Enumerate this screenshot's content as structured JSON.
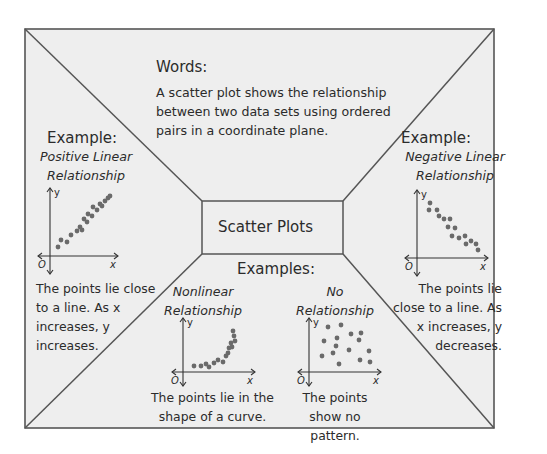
{
  "colors": {
    "background": "#ffffff",
    "frame_fill": "#eeeeee",
    "frame_stroke": "#555555",
    "text": "#2b2b2b",
    "dot": "#6a6a6a"
  },
  "frame": {
    "x1": 25,
    "y1": 29,
    "x2": 494,
    "y2": 428
  },
  "center_box": {
    "x1": 202,
    "y1": 201,
    "x2": 343,
    "y2": 254,
    "label": "Scatter Plots"
  },
  "words": {
    "title": "Words:",
    "body": "A scatter plot shows the relationship between two data sets using ordered pairs in a coordinate plane."
  },
  "examples_heading": "Examples:",
  "panels": [
    {
      "id": "positive",
      "title": "Example:",
      "subtitle_lines": [
        "Positive Linear",
        "Relationship"
      ],
      "description": "The points lie close to a line. As x increases, y increases.",
      "axis_labels": {
        "y": "y",
        "x": "x",
        "origin": "O"
      }
    },
    {
      "id": "negative",
      "title": "Example:",
      "subtitle_lines": [
        "Negative Linear",
        "Relationship"
      ],
      "description": "The points lie close to a line. As x increases, y decreases.",
      "axis_labels": {
        "y": "y",
        "x": "x",
        "origin": "O"
      }
    },
    {
      "id": "nonlinear",
      "subtitle_lines": [
        "Nonlinear",
        "Relationship"
      ],
      "description": "The points lie in the shape of a curve.",
      "axis_labels": {
        "y": "y",
        "x": "x",
        "origin": "O"
      }
    },
    {
      "id": "none",
      "subtitle_lines": [
        "No",
        "Relationship"
      ],
      "description": "The points show no pattern.",
      "axis_labels": {
        "y": "y",
        "x": "x",
        "origin": "O"
      }
    }
  ],
  "plots": {
    "positive": {
      "origin": [
        50,
        256
      ],
      "x_end": 118,
      "y_top": 188,
      "x_start": 38,
      "y_bottom": 274,
      "points": [
        [
          58,
          247
        ],
        [
          61,
          240
        ],
        [
          67,
          242
        ],
        [
          71,
          235
        ],
        [
          77,
          231
        ],
        [
          80,
          227
        ],
        [
          82,
          230
        ],
        [
          84,
          219
        ],
        [
          87,
          222
        ],
        [
          88,
          214
        ],
        [
          92,
          216
        ],
        [
          93,
          207
        ],
        [
          97,
          210
        ],
        [
          100,
          204
        ],
        [
          102,
          206
        ],
        [
          105,
          201
        ],
        [
          108,
          198
        ],
        [
          110,
          196
        ]
      ]
    },
    "negative": {
      "origin": [
        417,
        258
      ],
      "x_end": 488,
      "y_top": 190,
      "x_start": 405,
      "y_bottom": 276,
      "points": [
        [
          430,
          203
        ],
        [
          429,
          210
        ],
        [
          437,
          210
        ],
        [
          439,
          216
        ],
        [
          444,
          219
        ],
        [
          450,
          219
        ],
        [
          448,
          227
        ],
        [
          455,
          228
        ],
        [
          452,
          236
        ],
        [
          459,
          238
        ],
        [
          465,
          236
        ],
        [
          466,
          244
        ],
        [
          471,
          241
        ],
        [
          476,
          244
        ],
        [
          478,
          250
        ]
      ]
    },
    "nonlinear": {
      "origin": [
        183,
        372
      ],
      "x_end": 255,
      "y_top": 318,
      "x_start": 172,
      "y_bottom": 386,
      "points": [
        [
          194,
          366
        ],
        [
          201,
          366
        ],
        [
          206,
          364
        ],
        [
          209,
          367
        ],
        [
          214,
          363
        ],
        [
          218,
          360
        ],
        [
          223,
          362
        ],
        [
          226,
          356
        ],
        [
          228,
          353
        ],
        [
          229,
          348
        ],
        [
          232,
          347
        ],
        [
          231,
          343
        ],
        [
          235,
          341
        ],
        [
          234,
          336
        ],
        [
          233,
          331
        ]
      ]
    },
    "none": {
      "origin": [
        309,
        372
      ],
      "x_end": 381,
      "y_top": 318,
      "x_start": 298,
      "y_bottom": 386,
      "points": [
        [
          328,
          327
        ],
        [
          341,
          325
        ],
        [
          324,
          341
        ],
        [
          337,
          338
        ],
        [
          351,
          334
        ],
        [
          361,
          333
        ],
        [
          333,
          353
        ],
        [
          336,
          346
        ],
        [
          322,
          356
        ],
        [
          349,
          350
        ],
        [
          359,
          340
        ],
        [
          369,
          351
        ],
        [
          339,
          364
        ],
        [
          360,
          360
        ],
        [
          370,
          362
        ]
      ]
    }
  },
  "chart_data": [
    {
      "type": "scatter",
      "title": "Positive Linear Relationship",
      "xlabel": "x",
      "ylabel": "y",
      "trend": "increasing linear",
      "x": [
        1,
        1.5,
        2.5,
        3,
        4,
        4.5,
        5,
        5.5,
        5.8,
        6,
        6.5,
        6.8,
        7.3,
        7.8,
        8.2,
        8.6,
        9.1,
        9.5
      ],
      "y": [
        1,
        2,
        1.8,
        2.7,
        3.2,
        3.8,
        3.4,
        4.8,
        4.4,
        5.6,
        5.3,
        6.5,
        6,
        6.8,
        6.6,
        7.3,
        7.7,
        8
      ]
    },
    {
      "type": "scatter",
      "title": "Negative Linear Relationship",
      "xlabel": "x",
      "ylabel": "y",
      "trend": "decreasing linear",
      "x": [
        1.5,
        1.4,
        2.5,
        2.8,
        3.5,
        4.3,
        4,
        5,
        4.6,
        5.6,
        6.4,
        6.5,
        7.2,
        7.8,
        8.1
      ],
      "y": [
        8,
        7.1,
        7.1,
        6.3,
        5.9,
        5.9,
        4.8,
        4.6,
        3.6,
        3.4,
        3.6,
        2.6,
        3,
        2.6,
        1.8
      ]
    },
    {
      "type": "scatter",
      "title": "Nonlinear Relationship",
      "xlabel": "x",
      "ylabel": "y",
      "trend": "exponential curve",
      "x": [
        1.5,
        2.5,
        3.2,
        3.6,
        4.3,
        4.9,
        5.6,
        6,
        6.3,
        6.4,
        6.8,
        6.7,
        7.2,
        7.1,
        6.9
      ],
      "y": [
        0.7,
        0.7,
        1,
        0.6,
        1.2,
        1.6,
        1.3,
        2.2,
        2.6,
        3.3,
        3.4,
        4,
        4.2,
        4.9,
        5.6
      ]
    },
    {
      "type": "scatter",
      "title": "No Relationship",
      "xlabel": "x",
      "ylabel": "y",
      "trend": "none",
      "x": [
        2.6,
        4.4,
        2.1,
        3.9,
        5.8,
        7.2,
        3.3,
        3.7,
        1.8,
        5.5,
        6.9,
        8.3,
        4,
        6.9,
        8.4
      ],
      "y": [
        6.6,
        6.9,
        4.8,
        5.2,
        5.7,
        5.9,
        2.7,
        3.6,
        2.2,
        3,
        4.4,
        2.9,
        1.2,
        1.7,
        1.4
      ]
    }
  ]
}
